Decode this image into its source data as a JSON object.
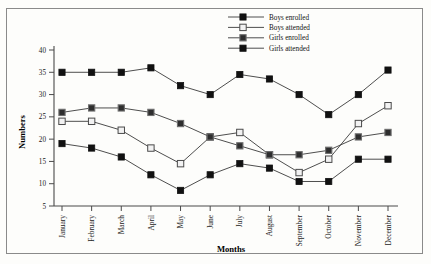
{
  "chart_data": {
    "type": "line",
    "title": "",
    "xlabel": "Months",
    "ylabel": "Numbers",
    "categories": [
      "January",
      "February",
      "March",
      "April",
      "May",
      "June",
      "July",
      "August",
      "September",
      "October",
      "November",
      "December"
    ],
    "ylim": [
      5,
      40
    ],
    "yticks": [
      5,
      10,
      15,
      20,
      25,
      30,
      35,
      40
    ],
    "grid": false,
    "legend_position": "top-right",
    "series": [
      {
        "name": "Boys enrolled",
        "marker": "filled-square",
        "color": "#111111",
        "values": [
          35,
          35,
          35,
          36,
          32,
          30,
          34.5,
          33.5,
          30,
          25.5,
          30,
          35.5
        ]
      },
      {
        "name": "Boys attended",
        "marker": "hollow-square",
        "color": "#f2f2f2",
        "values": [
          24,
          24,
          22,
          18,
          14.5,
          20.5,
          21.5,
          16.5,
          12.5,
          15.5,
          23.5,
          27.5
        ]
      },
      {
        "name": "Girls enrolled",
        "marker": "grey-square",
        "color": "#2e2e2e",
        "values": [
          26,
          27,
          27,
          26,
          23.5,
          20.5,
          18.5,
          16.5,
          16.5,
          17.5,
          20.5,
          21.5
        ]
      },
      {
        "name": "Girls attended",
        "marker": "filled-square",
        "color": "#111111",
        "values": [
          19,
          18,
          16,
          12,
          8.5,
          12,
          14.5,
          13.5,
          10.5,
          10.5,
          15.5,
          15.5
        ]
      }
    ]
  },
  "axis": {
    "y_title": "Numbers",
    "x_title": "Months"
  }
}
